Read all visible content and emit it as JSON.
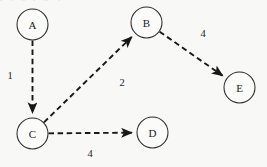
{
  "figure": {
    "title_clipped_fragment": "y  j  g  p  g  q",
    "background_color": "#f8f8f7",
    "stroke_color": "#171717",
    "node_fill": "#fbfbfa"
  },
  "chart_data": {
    "type": "diagram",
    "diagram_kind": "directed-weighted-graph",
    "title": "",
    "xlabel": "",
    "ylabel": "",
    "grid": false,
    "legend": null,
    "node_radius": 15.5,
    "edge_style": "dashed",
    "arrowheads": true,
    "nodes": [
      {
        "id": "A",
        "label": "A",
        "x": 32.5,
        "y": 24.5
      },
      {
        "id": "B",
        "label": "B",
        "x": 146.5,
        "y": 22.5
      },
      {
        "id": "C",
        "label": "C",
        "x": 32.5,
        "y": 133.5
      },
      {
        "id": "D",
        "label": "D",
        "x": 152.5,
        "y": 132.5
      },
      {
        "id": "E",
        "label": "E",
        "x": 239.5,
        "y": 87.5
      }
    ],
    "edges": [
      {
        "from": "A",
        "to": "C",
        "weight": 1,
        "label": "1",
        "label_x": 10,
        "label_y": 75
      },
      {
        "from": "C",
        "to": "B",
        "weight": 2,
        "label": "2",
        "label_x": 122,
        "label_y": 82
      },
      {
        "from": "B",
        "to": "E",
        "weight": 4,
        "label": "4",
        "label_x": 203,
        "label_y": 33
      },
      {
        "from": "C",
        "to": "D",
        "weight": 4,
        "label": "4",
        "label_x": 90,
        "label_y": 153
      }
    ]
  }
}
